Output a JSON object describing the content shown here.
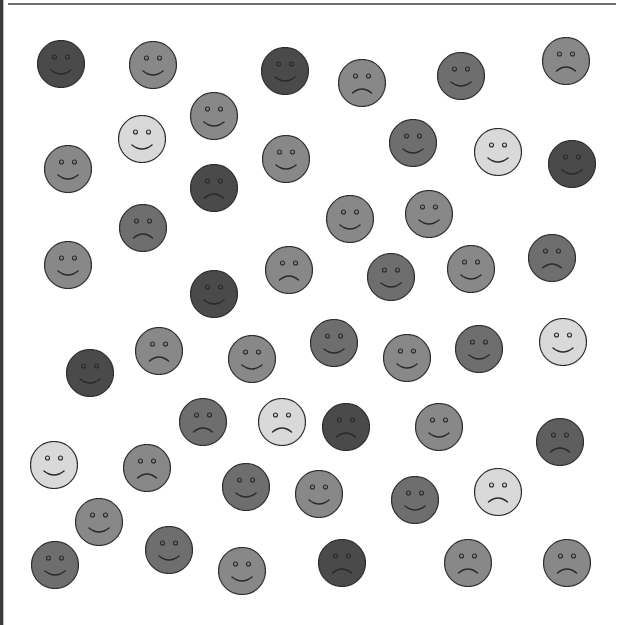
{
  "scene": {
    "description": "Scattered grayscale smiley and frowny faces",
    "radius": 24,
    "shades": {
      "very_dark": "#4a4a4a",
      "dark": "#5e5e5e",
      "dark_mid": "#6e6e6e",
      "mid": "#888888",
      "light": "#d9d9d9"
    },
    "outline_color": "#2e2e2e",
    "feature_color": "#2a2a2a",
    "faces": [
      {
        "x": 61,
        "y": 64,
        "shade": "very_dark",
        "mood": "smile"
      },
      {
        "x": 153,
        "y": 65,
        "shade": "mid",
        "mood": "smile"
      },
      {
        "x": 285,
        "y": 71,
        "shade": "very_dark",
        "mood": "smile"
      },
      {
        "x": 362,
        "y": 83,
        "shade": "mid",
        "mood": "frown"
      },
      {
        "x": 461,
        "y": 76,
        "shade": "dark_mid",
        "mood": "smile"
      },
      {
        "x": 566,
        "y": 61,
        "shade": "mid",
        "mood": "frown"
      },
      {
        "x": 214,
        "y": 116,
        "shade": "mid",
        "mood": "smile"
      },
      {
        "x": 142,
        "y": 139,
        "shade": "light",
        "mood": "smile"
      },
      {
        "x": 68,
        "y": 169,
        "shade": "mid",
        "mood": "smile"
      },
      {
        "x": 286,
        "y": 159,
        "shade": "mid",
        "mood": "smile"
      },
      {
        "x": 413,
        "y": 143,
        "shade": "dark_mid",
        "mood": "smile"
      },
      {
        "x": 498,
        "y": 152,
        "shade": "light",
        "mood": "smile"
      },
      {
        "x": 572,
        "y": 164,
        "shade": "very_dark",
        "mood": "smile"
      },
      {
        "x": 214,
        "y": 188,
        "shade": "very_dark",
        "mood": "frown"
      },
      {
        "x": 143,
        "y": 228,
        "shade": "dark_mid",
        "mood": "frown"
      },
      {
        "x": 350,
        "y": 219,
        "shade": "mid",
        "mood": "smile"
      },
      {
        "x": 429,
        "y": 214,
        "shade": "mid",
        "mood": "smile"
      },
      {
        "x": 68,
        "y": 265,
        "shade": "mid",
        "mood": "smile"
      },
      {
        "x": 214,
        "y": 294,
        "shade": "very_dark",
        "mood": "smile"
      },
      {
        "x": 289,
        "y": 270,
        "shade": "mid",
        "mood": "frown"
      },
      {
        "x": 391,
        "y": 277,
        "shade": "dark_mid",
        "mood": "smile"
      },
      {
        "x": 471,
        "y": 269,
        "shade": "mid",
        "mood": "smile"
      },
      {
        "x": 552,
        "y": 258,
        "shade": "dark_mid",
        "mood": "frown"
      },
      {
        "x": 159,
        "y": 351,
        "shade": "mid",
        "mood": "frown"
      },
      {
        "x": 90,
        "y": 373,
        "shade": "very_dark",
        "mood": "smile"
      },
      {
        "x": 252,
        "y": 359,
        "shade": "mid",
        "mood": "smile"
      },
      {
        "x": 334,
        "y": 343,
        "shade": "dark_mid",
        "mood": "smile"
      },
      {
        "x": 407,
        "y": 358,
        "shade": "mid",
        "mood": "smile"
      },
      {
        "x": 479,
        "y": 349,
        "shade": "dark_mid",
        "mood": "smile"
      },
      {
        "x": 563,
        "y": 342,
        "shade": "light",
        "mood": "smile"
      },
      {
        "x": 203,
        "y": 422,
        "shade": "dark_mid",
        "mood": "frown"
      },
      {
        "x": 282,
        "y": 422,
        "shade": "light",
        "mood": "frown"
      },
      {
        "x": 346,
        "y": 427,
        "shade": "very_dark",
        "mood": "frown"
      },
      {
        "x": 439,
        "y": 427,
        "shade": "mid",
        "mood": "smile"
      },
      {
        "x": 560,
        "y": 442,
        "shade": "dark",
        "mood": "frown"
      },
      {
        "x": 54,
        "y": 465,
        "shade": "light",
        "mood": "smile"
      },
      {
        "x": 147,
        "y": 468,
        "shade": "mid",
        "mood": "frown"
      },
      {
        "x": 246,
        "y": 487,
        "shade": "dark_mid",
        "mood": "smile"
      },
      {
        "x": 319,
        "y": 494,
        "shade": "mid",
        "mood": "smile"
      },
      {
        "x": 415,
        "y": 500,
        "shade": "dark_mid",
        "mood": "smile"
      },
      {
        "x": 498,
        "y": 492,
        "shade": "light",
        "mood": "frown"
      },
      {
        "x": 99,
        "y": 522,
        "shade": "mid",
        "mood": "smile"
      },
      {
        "x": 55,
        "y": 565,
        "shade": "dark_mid",
        "mood": "smile"
      },
      {
        "x": 169,
        "y": 550,
        "shade": "dark_mid",
        "mood": "smile"
      },
      {
        "x": 242,
        "y": 571,
        "shade": "mid",
        "mood": "smile"
      },
      {
        "x": 342,
        "y": 563,
        "shade": "very_dark",
        "mood": "frown"
      },
      {
        "x": 468,
        "y": 563,
        "shade": "mid",
        "mood": "frown"
      },
      {
        "x": 567,
        "y": 563,
        "shade": "mid",
        "mood": "frown"
      }
    ]
  }
}
